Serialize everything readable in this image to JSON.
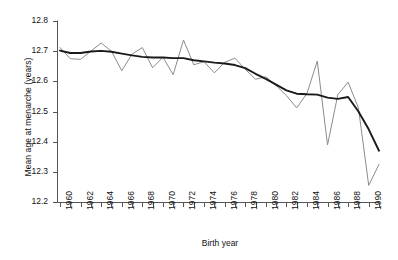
{
  "chart_data": {
    "type": "line",
    "title": "",
    "xlabel": "Birth year",
    "ylabel": "Mean age at menarche (years)",
    "xlim": [
      1959.5,
      1991.5
    ],
    "ylim": [
      12.2,
      12.8
    ],
    "ytick_values": [
      12.2,
      12.3,
      12.4,
      12.5,
      12.6,
      12.7,
      12.8
    ],
    "ytick_labels": [
      "12.2",
      "12.3",
      "12.4",
      "12.5",
      "12.6",
      "12.7",
      "12.8"
    ],
    "xtick_values": [
      1960,
      1961,
      1962,
      1963,
      1964,
      1965,
      1966,
      1967,
      1968,
      1969,
      1970,
      1971,
      1972,
      1973,
      1974,
      1975,
      1976,
      1977,
      1978,
      1979,
      1980,
      1981,
      1982,
      1983,
      1984,
      1985,
      1986,
      1987,
      1988,
      1989,
      1990,
      1991
    ],
    "xtick_labels": [
      "1960",
      "",
      "1962",
      "",
      "1964",
      "",
      "1966",
      "",
      "1968",
      "",
      "1970",
      "",
      "1972",
      "",
      "1974",
      "",
      "1976",
      "",
      "1978",
      "",
      "1980",
      "",
      "1982",
      "",
      "1984",
      "",
      "1986",
      "",
      "1988",
      "",
      "1990",
      ""
    ],
    "xtick_label_interval": 2,
    "grid": false,
    "legend": false,
    "x": [
      1960,
      1961,
      1962,
      1963,
      1964,
      1965,
      1966,
      1967,
      1968,
      1969,
      1970,
      1971,
      1972,
      1973,
      1974,
      1975,
      1976,
      1977,
      1978,
      1979,
      1980,
      1981,
      1982,
      1983,
      1984,
      1985,
      1986,
      1987,
      1988,
      1989,
      1990,
      1991
    ],
    "series": [
      {
        "name": "Observed mean age at menarche",
        "style": "thin-grey-line",
        "color": "#8c8c8c",
        "values": [
          12.712,
          12.675,
          12.673,
          12.7,
          12.727,
          12.7,
          12.635,
          12.69,
          12.712,
          12.645,
          12.68,
          12.622,
          12.737,
          12.655,
          12.665,
          12.628,
          12.663,
          12.677,
          12.64,
          12.607,
          12.615,
          12.586,
          12.553,
          12.512,
          12.56,
          12.667,
          12.389,
          12.556,
          12.597,
          12.512,
          12.255,
          12.325
        ]
      },
      {
        "name": "Smoothed trend",
        "style": "thick-black-line",
        "color": "#1a1a1a",
        "values": [
          12.702,
          12.694,
          12.694,
          12.699,
          12.701,
          12.698,
          12.692,
          12.686,
          12.681,
          12.679,
          12.679,
          12.677,
          12.677,
          12.67,
          12.666,
          12.662,
          12.659,
          12.654,
          12.644,
          12.625,
          12.608,
          12.589,
          12.57,
          12.559,
          12.557,
          12.556,
          12.546,
          12.542,
          12.548,
          12.5,
          12.441,
          12.37
        ]
      }
    ]
  },
  "axis": {
    "y_axis_label": "Mean age at menarche (years)",
    "x_axis_label": "Birth year"
  }
}
